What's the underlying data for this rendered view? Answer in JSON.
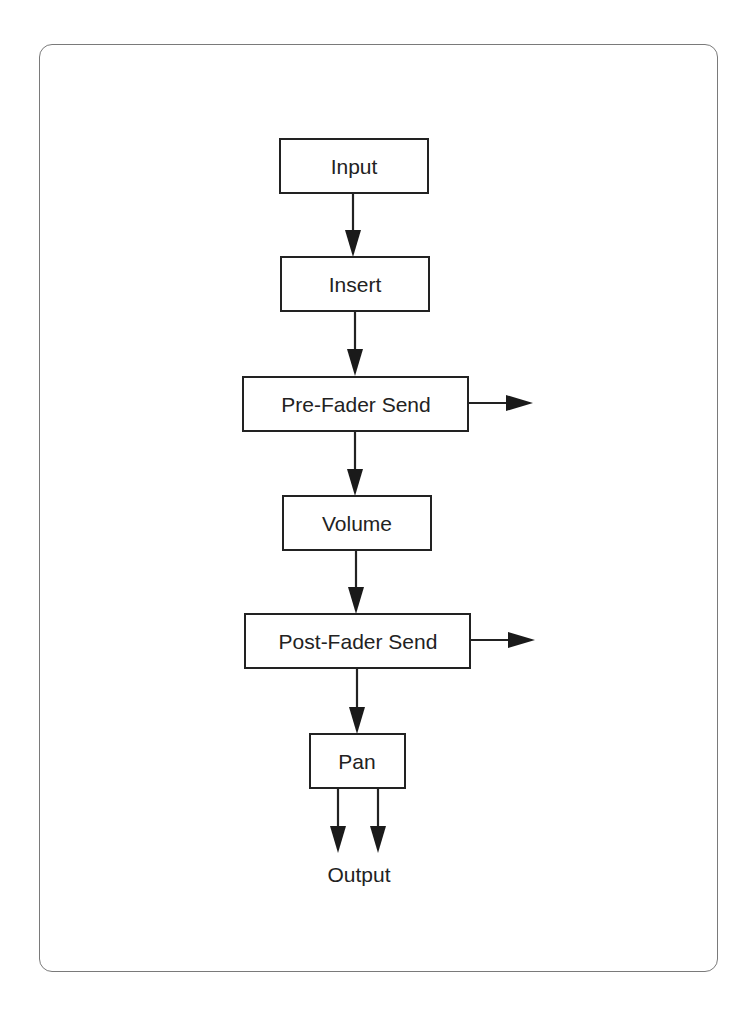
{
  "diagram": {
    "title": "",
    "nodes": [
      {
        "id": "input",
        "label": "Input"
      },
      {
        "id": "insert",
        "label": "Insert"
      },
      {
        "id": "pre_fader_send",
        "label": "Pre-Fader Send"
      },
      {
        "id": "volume",
        "label": "Volume"
      },
      {
        "id": "post_fader_send",
        "label": "Post-Fader Send"
      },
      {
        "id": "pan",
        "label": "Pan"
      }
    ],
    "output_label": "Output",
    "edges": [
      {
        "from": "input",
        "to": "insert"
      },
      {
        "from": "insert",
        "to": "pre_fader_send"
      },
      {
        "from": "pre_fader_send",
        "to": "volume"
      },
      {
        "from": "pre_fader_send",
        "to": "send-out-right"
      },
      {
        "from": "volume",
        "to": "post_fader_send"
      },
      {
        "from": "post_fader_send",
        "to": "send-out-right"
      },
      {
        "from": "post_fader_send",
        "to": "pan"
      },
      {
        "from": "pan",
        "to": "output-left"
      },
      {
        "from": "pan",
        "to": "output-right"
      }
    ]
  }
}
